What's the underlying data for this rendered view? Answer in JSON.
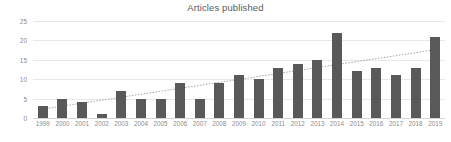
{
  "chart_data": {
    "type": "bar",
    "title": "Articles published",
    "xlabel": "",
    "ylabel": "",
    "ylim": [
      0,
      25
    ],
    "yticks": [
      0,
      5,
      10,
      15,
      20,
      25
    ],
    "grid": true,
    "legend": "none",
    "categories": [
      "1999",
      "2000",
      "2001",
      "2002",
      "2003",
      "2004",
      "2005",
      "2006",
      "2007",
      "2008",
      "2009",
      "2010",
      "2011",
      "2012",
      "2013",
      "2014",
      "2015",
      "2016",
      "2017",
      "2018",
      "2019"
    ],
    "values": [
      3,
      5,
      4,
      1,
      7,
      5,
      5,
      9,
      5,
      9,
      11,
      10,
      13,
      14,
      15,
      22,
      12,
      13,
      11,
      13,
      21
    ],
    "series": [
      {
        "name": "Articles published",
        "values": [
          3,
          5,
          4,
          1,
          7,
          5,
          5,
          9,
          5,
          9,
          11,
          10,
          13,
          14,
          15,
          22,
          12,
          13,
          11,
          13,
          21
        ],
        "color": "#595959",
        "type": "bar"
      },
      {
        "name": "Linear trendline",
        "type": "line",
        "style": "dotted",
        "color": "#a6a6a6",
        "start_value": 2.3,
        "end_value": 17.6
      }
    ],
    "annotations": []
  },
  "colors": {
    "bar": "#595959",
    "trendline": "#a6a6a6",
    "gridline": "#e8e8e8",
    "axis_text": "#8d8d8d",
    "title_text": "#5a5a5a",
    "background": "#ffffff"
  }
}
